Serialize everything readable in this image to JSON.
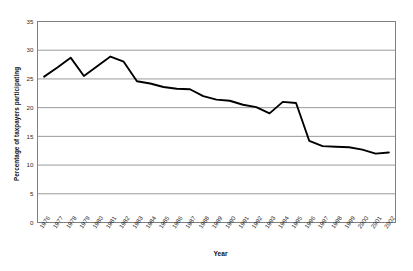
{
  "chart_data": {
    "type": "line",
    "title": "",
    "xlabel": "Year",
    "ylabel": "Percentage of taxpayers participating",
    "ylim": [
      0,
      35
    ],
    "ytick_step": 5,
    "yticks": [
      0,
      5,
      10,
      15,
      20,
      25,
      30,
      35
    ],
    "grid": "horizontal",
    "legend": "none",
    "line_color": "#000000",
    "gridline_color": "#808080",
    "axis_color": "#808080",
    "background": "#ffffff",
    "x": [
      1976,
      1977,
      1978,
      1979,
      1980,
      1981,
      1982,
      1983,
      1984,
      1985,
      1986,
      1987,
      1988,
      1989,
      1990,
      1991,
      1992,
      1993,
      1994,
      1995,
      1996,
      1997,
      1998,
      1999,
      2000,
      2001,
      2002
    ],
    "categories": [
      "1976",
      "1977",
      "1978",
      "1979",
      "1980",
      "1981",
      "1982",
      "1983",
      "1984",
      "1985",
      "1986",
      "1987",
      "1988",
      "1989",
      "1990",
      "1991",
      "1992",
      "1993",
      "1994",
      "1995",
      "1996",
      "1997",
      "1998",
      "1999",
      "2000",
      "2001",
      "2002"
    ],
    "values": [
      25.4,
      27.0,
      28.7,
      25.5,
      27.2,
      28.9,
      28.0,
      24.6,
      24.2,
      23.6,
      23.3,
      23.2,
      22.0,
      21.4,
      21.2,
      20.5,
      20.1,
      19.0,
      21.0,
      20.8,
      14.2,
      13.3,
      13.2,
      13.1,
      12.7,
      12.0,
      12.2
    ],
    "series": [
      {
        "name": "Percentage of taxpayers participating",
        "values": [
          25.4,
          27.0,
          28.7,
          25.5,
          27.2,
          28.9,
          28.0,
          24.6,
          24.2,
          23.6,
          23.3,
          23.2,
          22.0,
          21.4,
          21.2,
          20.5,
          20.1,
          19.0,
          21.0,
          20.8,
          14.2,
          13.3,
          13.2,
          13.1,
          12.7,
          12.0,
          12.2
        ]
      }
    ]
  }
}
